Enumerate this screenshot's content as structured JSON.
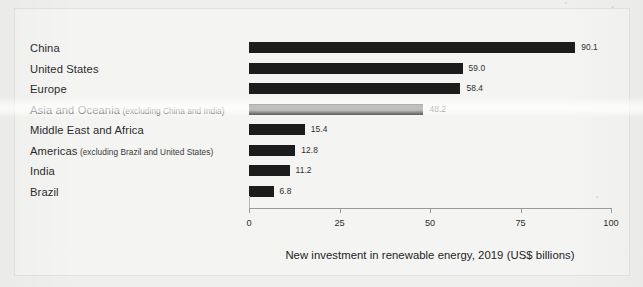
{
  "chart_data": {
    "type": "bar",
    "orientation": "horizontal",
    "title": "",
    "xlabel": "New investment in renewable energy, 2019 (US$ billions)",
    "ylabel": "",
    "xlim": [
      0,
      100
    ],
    "xticks": [
      "0",
      "25",
      "50",
      "75",
      "100"
    ],
    "grid": false,
    "legend": "none",
    "bar_color": "#1c1c1c",
    "categories": [
      "China",
      "United States",
      "Europe",
      "Asia and Oceania",
      "Middle East and Africa",
      "Americas",
      "India",
      "Brazil"
    ],
    "category_qualifiers": [
      "",
      "",
      "",
      "(excluding China and India)",
      "",
      "(excluding Brazil and United States)",
      "",
      ""
    ],
    "values": [
      90.1,
      59.0,
      58.4,
      48.2,
      15.4,
      12.8,
      11.2,
      6.8
    ],
    "value_labels": [
      "90.1",
      "59.0",
      "58.4",
      "48.2",
      "15.4",
      "12.8",
      "11.2",
      "6.8"
    ]
  },
  "axis": {
    "title": "New investment in renewable energy, 2019 (US$ billions)",
    "ticks": [
      "0",
      "25",
      "50",
      "75",
      "100"
    ]
  }
}
